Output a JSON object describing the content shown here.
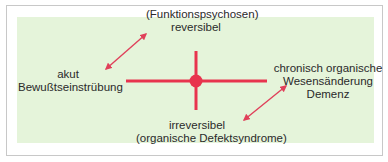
{
  "colors": {
    "accent": "#e8344e",
    "arrow": "#e0405a",
    "panel_bg": "#e5f4da",
    "frame_border": "#c8c8c8",
    "text": "#2a2a2a"
  },
  "diagram": {
    "center_node": "red-dot",
    "axes": {
      "top": {
        "line1": "(Funktionspsychosen)",
        "line2": "reversibel"
      },
      "bottom": {
        "line1": "irreversibel",
        "line2": "(organische Defektsyndrome)"
      },
      "left": {
        "line1": "akut",
        "line2": "Bewußtseinstrübung"
      },
      "right": {
        "line1": "chronisch organische",
        "line2": "Wesensänderung",
        "line3": "Demenz"
      }
    },
    "arrows": [
      {
        "from": "left",
        "to": "top",
        "type": "double-headed"
      },
      {
        "from": "bottom",
        "to": "right",
        "type": "double-headed"
      }
    ]
  }
}
